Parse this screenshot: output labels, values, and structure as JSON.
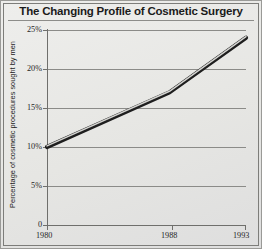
{
  "chart_data": {
    "type": "line",
    "title": "The Changing Profile of Cosmetic Surgery",
    "xlabel": "",
    "ylabel": "Percentage of cosmetic procedures sought by men",
    "x": [
      1980,
      1988,
      1993
    ],
    "values": [
      10,
      17,
      24
    ],
    "series": [
      {
        "name": "Percentage of cosmetic procedures sought by men",
        "values": [
          10,
          17,
          24
        ]
      }
    ],
    "xlim": [
      1980,
      1993
    ],
    "ylim": [
      0,
      25
    ],
    "x_tick_labels": [
      "1980",
      "1988",
      "1993"
    ],
    "y_tick_values": [
      0,
      5,
      10,
      15,
      20,
      25
    ],
    "y_tick_labels": [
      "0",
      "5%",
      "10%",
      "15%",
      "20%",
      "25%"
    ],
    "grid": true,
    "legend": false,
    "colors": {
      "background": "#e9e9e7",
      "line": "#2a2a2a",
      "line_highlight": "#c9c9c6",
      "grid": "#8b8b88",
      "axis": "#6f6f6c",
      "text": "#1f1f1f",
      "frame": "#7d7d7a"
    }
  },
  "figure": {
    "title": "The Changing Profile of Cosmetic Surgery",
    "y_axis_title": "Percentage of cosmetic procedures sought by men",
    "y_ticks": [
      {
        "label": "25%"
      },
      {
        "label": "20%"
      },
      {
        "label": "15%"
      },
      {
        "label": "10%"
      },
      {
        "label": "5%"
      },
      {
        "label": "0"
      }
    ],
    "x_ticks": [
      {
        "label": "1980"
      },
      {
        "label": "1988"
      },
      {
        "label": "1993"
      }
    ]
  }
}
